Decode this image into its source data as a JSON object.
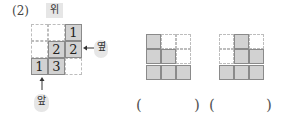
{
  "question": {
    "number_label": "(2)",
    "top_view_label": "위",
    "side_label": "옆",
    "front_label": "앞"
  },
  "top_view_grid": {
    "rows": 3,
    "cols": 3,
    "counts": [
      [
        null,
        null,
        1
      ],
      [
        null,
        2,
        2
      ],
      [
        1,
        3,
        null
      ]
    ]
  },
  "answer_options": [
    {
      "name": "option-1",
      "column_heights": [
        3,
        2,
        1
      ],
      "answer_text": ""
    },
    {
      "name": "option-2",
      "column_heights": [
        1,
        3,
        2
      ],
      "answer_text": ""
    }
  ],
  "parentheses": {
    "open": "(",
    "close": ")"
  },
  "colors": {
    "filled_cell": "#d2d2d2",
    "cell_border": "#8a8a8a",
    "dashed_border": "#bdbdbd",
    "label_bg": "#e6e6e6"
  }
}
